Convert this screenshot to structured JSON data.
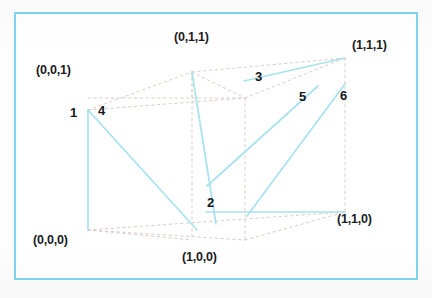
{
  "figure": {
    "border_color": "#7fd4f0",
    "edge_color": "#9fe0ef",
    "dashed_color": "#d8c9c9",
    "text_color": "#1b1b22",
    "background": "#ffffff"
  },
  "vertices": [
    {
      "id": "v001",
      "label": "(0,0,1)",
      "x": 36,
      "y": 70,
      "px": 88,
      "py": 110
    },
    {
      "id": "v011",
      "label": "(0,1,1)",
      "x": 175,
      "y": 35,
      "px": 192,
      "py": 72
    },
    {
      "id": "v111",
      "label": "(1,1,1)",
      "x": 356,
      "y": 42,
      "px": 345,
      "py": 58
    },
    {
      "id": "v000",
      "label": "(0,0,0)",
      "x": 34,
      "y": 238,
      "px": 88,
      "py": 230
    },
    {
      "id": "v100",
      "label": "(1,0,0)",
      "x": 182,
      "y": 254,
      "px": 214,
      "py": 240
    },
    {
      "id": "v110",
      "label": "(1,1,0)",
      "x": 338,
      "y": 216,
      "px": 345,
      "py": 212
    }
  ],
  "edges": [
    {
      "id": "e1",
      "label": "1",
      "label_x": 71,
      "label_y": 106,
      "x1": 88,
      "y1": 110,
      "x2": 88,
      "y2": 230
    },
    {
      "id": "e2",
      "label": "2",
      "label_x": 208,
      "label_y": 196,
      "x1": 192,
      "y1": 72,
      "x2": 216,
      "y2": 224
    },
    {
      "id": "e3",
      "label": "3",
      "label_x": 256,
      "label_y": 70,
      "x1": 244,
      "y1": 81,
      "x2": 345,
      "y2": 58
    },
    {
      "id": "e4",
      "label": "4",
      "label_x": 99,
      "label_y": 104,
      "x1": 88,
      "y1": 110,
      "x2": 197,
      "y2": 230
    },
    {
      "id": "e5",
      "label": "5",
      "label_x": 300,
      "label_y": 90,
      "x1": 207,
      "y1": 186,
      "x2": 318,
      "y2": 86
    },
    {
      "id": "e6",
      "label": "6",
      "label_x": 341,
      "label_y": 89,
      "x1": 247,
      "y1": 216,
      "x2": 345,
      "y2": 84
    }
  ],
  "cube_structure": {
    "description": "dashed wireframe cube in oblique projection with six highlighted edges",
    "dashed_segments": [
      {
        "from": "(0,0,1)",
        "to": "(0,1,1)"
      },
      {
        "from": "(0,1,1)",
        "to": "(1,1,1)"
      },
      {
        "from": "(0,0,1)",
        "to": "(1,0,1)"
      },
      {
        "from": "(1,0,1)",
        "to": "(1,1,1)"
      },
      {
        "from": "(1,0,1)",
        "to": "(1,0,0)"
      },
      {
        "from": "(1,1,1)",
        "to": "(1,1,0)"
      },
      {
        "from": "(0,0,0)",
        "to": "(1,0,0)"
      },
      {
        "from": "(1,0,0)",
        "to": "(1,1,0)"
      },
      {
        "from": "(0,0,0)",
        "to": "(1,1,0)"
      },
      {
        "from": "(0,1,1)",
        "to": "(1,0,1)"
      }
    ]
  }
}
